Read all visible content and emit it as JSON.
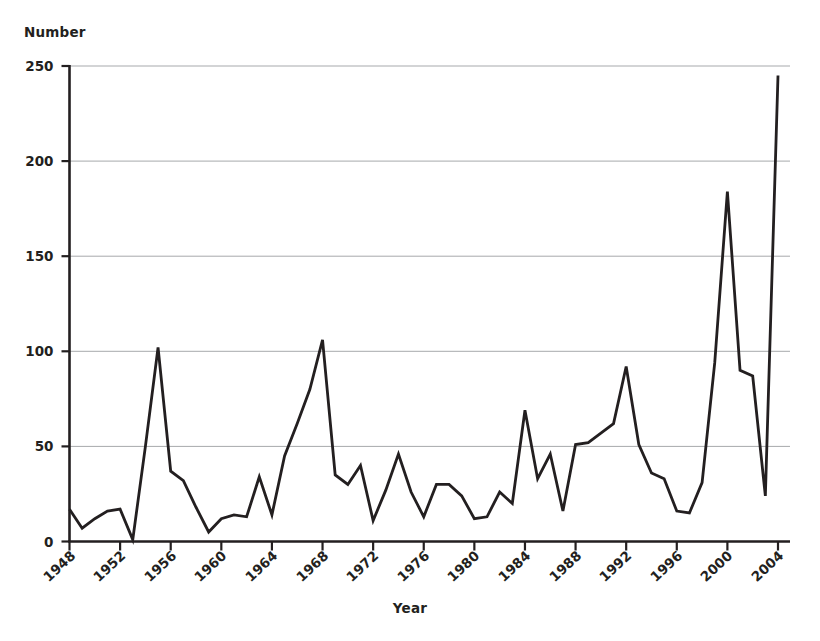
{
  "chart_data": {
    "type": "line",
    "title": "",
    "xlabel": "Year",
    "ylabel": "Number",
    "xlim": [
      1948,
      2004
    ],
    "ylim": [
      0,
      250
    ],
    "grid": true,
    "legend": "none",
    "line_color": "#231f20",
    "grid_color": "#a7a9ac",
    "axis_color": "#231f20",
    "ytick_labels": [
      "0",
      "50",
      "100",
      "150",
      "200",
      "250"
    ],
    "ytick_values": [
      0,
      50,
      100,
      150,
      200,
      250
    ],
    "xtick_labels": [
      "1948",
      "1952",
      "1956",
      "1960",
      "1964",
      "1968",
      "1972",
      "1976",
      "1980",
      "1984",
      "1988",
      "1992",
      "1996",
      "2000",
      "2004"
    ],
    "xtick_values": [
      1948,
      1952,
      1956,
      1960,
      1964,
      1968,
      1972,
      1976,
      1980,
      1984,
      1988,
      1992,
      1996,
      2000,
      2004
    ],
    "x": [
      1948,
      1949,
      1950,
      1951,
      1952,
      1953,
      1954,
      1955,
      1956,
      1957,
      1958,
      1959,
      1960,
      1961,
      1962,
      1963,
      1964,
      1965,
      1966,
      1967,
      1968,
      1969,
      1970,
      1971,
      1972,
      1973,
      1974,
      1975,
      1976,
      1977,
      1978,
      1979,
      1980,
      1981,
      1982,
      1983,
      1984,
      1985,
      1986,
      1987,
      1988,
      1989,
      1990,
      1991,
      1992,
      1993,
      1994,
      1995,
      1996,
      1997,
      1998,
      1999,
      2000,
      2001,
      2002,
      2003,
      2004
    ],
    "values": [
      17,
      7,
      12,
      16,
      17,
      1,
      50,
      102,
      37,
      32,
      18,
      5,
      12,
      14,
      13,
      34,
      14,
      45,
      62,
      80,
      106,
      35,
      30,
      40,
      11,
      27,
      46,
      26,
      13,
      30,
      30,
      24,
      12,
      13,
      26,
      20,
      69,
      33,
      46,
      16,
      51,
      52,
      57,
      62,
      92,
      51,
      36,
      33,
      16,
      15,
      31,
      94,
      184,
      90,
      87,
      24,
      245
    ]
  }
}
